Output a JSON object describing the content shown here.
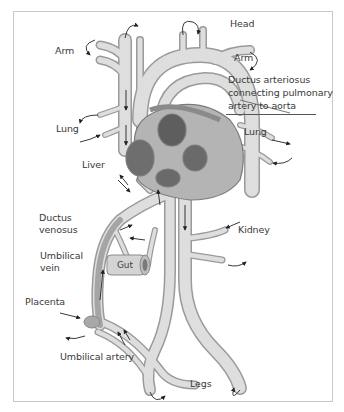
{
  "figure": {
    "labels": {
      "head": "Head",
      "arm_left": "Arm",
      "arm_right": "Arm",
      "ductus_arteriosus": [
        "Ductus arteriosus",
        "connecting pulmonary",
        "artery to aorta"
      ],
      "lung_left": "Lung",
      "lung_right": "Lung",
      "liver": "Liver",
      "ductus_venosus": [
        "Ductus",
        "venosus"
      ],
      "umbilical_vein": [
        "Umbilical",
        "vein"
      ],
      "gut": "Gut",
      "kidney": "Kidney",
      "placenta": "Placenta",
      "umbilical_artery": "Umbilical artery",
      "legs": "Legs"
    },
    "colors": {
      "vessel_fill": "#d9d9d9",
      "vessel_edge": "#9a9a9a",
      "heart_dark": "#6e6e6e",
      "heart_mid": "#a8a8a8",
      "arrow": "#222222",
      "frame": "#c8c8c8",
      "text": "#3a3a3a"
    }
  }
}
